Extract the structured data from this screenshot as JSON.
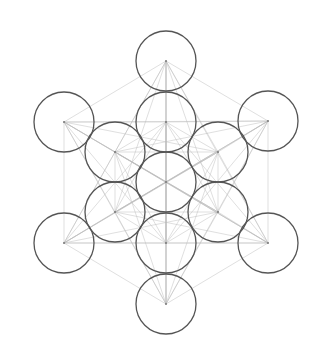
{
  "diagram": {
    "name": "Metatron's Cube",
    "background": "#ffffff",
    "circle_color": "#555555",
    "line_color": "#bbbbbb",
    "circle_radius": 30,
    "centers": [
      {
        "id": "center",
        "x": 166,
        "y": 182
      },
      {
        "id": "inner-top",
        "x": 166,
        "y": 122
      },
      {
        "id": "inner-upper-right",
        "x": 218,
        "y": 152
      },
      {
        "id": "inner-lower-right",
        "x": 218,
        "y": 212
      },
      {
        "id": "inner-bottom",
        "x": 166,
        "y": 243
      },
      {
        "id": "inner-lower-left",
        "x": 115,
        "y": 212
      },
      {
        "id": "inner-upper-left",
        "x": 115,
        "y": 152
      },
      {
        "id": "outer-top",
        "x": 166,
        "y": 61
      },
      {
        "id": "outer-upper-right",
        "x": 268,
        "y": 121
      },
      {
        "id": "outer-lower-right",
        "x": 268,
        "y": 243
      },
      {
        "id": "outer-bottom",
        "x": 166,
        "y": 304
      },
      {
        "id": "outer-lower-left",
        "x": 64,
        "y": 243
      },
      {
        "id": "outer-upper-left",
        "x": 64,
        "y": 122
      }
    ]
  }
}
